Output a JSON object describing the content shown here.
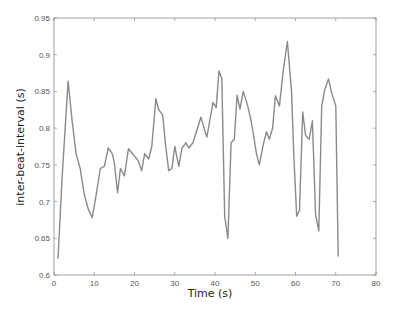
{
  "chart_data": {
    "type": "line",
    "title": "",
    "xlabel": "Time (s)",
    "ylabel": "inter-beat-interval (s)",
    "xlim": [
      0,
      80
    ],
    "ylim": [
      0.6,
      0.95
    ],
    "xticks": [
      "0",
      "10",
      "20",
      "30",
      "40",
      "50",
      "60",
      "70",
      "80"
    ],
    "yticks": [
      "0.6",
      "0.65",
      "0.7",
      "0.75",
      "0.8",
      "0.85",
      "0.9",
      "0.95"
    ],
    "grid": false,
    "legend": null,
    "series": [
      {
        "name": "inter-beat-interval",
        "color": "#8a8a8a",
        "x": [
          1,
          2,
          3.5,
          4.5,
          5.5,
          6.5,
          7.5,
          8.5,
          9.5,
          10.5,
          11.5,
          12.5,
          13.5,
          14.5,
          15,
          15.8,
          16.5,
          17.5,
          18.5,
          19.5,
          20.3,
          21,
          21.8,
          22.5,
          23.5,
          24.3,
          25.3,
          26,
          27,
          27.7,
          28.5,
          29.3,
          30,
          31,
          31.8,
          32.8,
          33.5,
          34.5,
          35.5,
          36.5,
          37.5,
          38,
          39,
          39.5,
          40.3,
          41,
          41.7,
          42.4,
          43.2,
          44,
          44.8,
          45.5,
          46.2,
          47,
          48,
          48.8,
          49.6,
          50.3,
          51,
          52,
          52.8,
          53.5,
          54.3,
          55,
          56,
          57,
          58,
          59,
          59.6,
          60.3,
          61,
          61.8,
          62.5,
          63.4,
          64.2,
          65,
          65.8,
          66.5,
          67.3,
          68.2,
          69,
          70,
          70.6
        ],
        "y": [
          0.622,
          0.73,
          0.864,
          0.81,
          0.765,
          0.745,
          0.71,
          0.69,
          0.678,
          0.71,
          0.745,
          0.748,
          0.773,
          0.765,
          0.752,
          0.712,
          0.745,
          0.735,
          0.772,
          0.765,
          0.76,
          0.755,
          0.742,
          0.765,
          0.758,
          0.775,
          0.84,
          0.825,
          0.818,
          0.778,
          0.742,
          0.745,
          0.775,
          0.748,
          0.773,
          0.78,
          0.773,
          0.78,
          0.797,
          0.815,
          0.796,
          0.788,
          0.82,
          0.835,
          0.828,
          0.878,
          0.868,
          0.68,
          0.65,
          0.78,
          0.785,
          0.845,
          0.826,
          0.85,
          0.833,
          0.815,
          0.79,
          0.765,
          0.75,
          0.778,
          0.795,
          0.785,
          0.8,
          0.844,
          0.83,
          0.88,
          0.918,
          0.85,
          0.76,
          0.68,
          0.688,
          0.822,
          0.79,
          0.785,
          0.81,
          0.682,
          0.66,
          0.83,
          0.853,
          0.867,
          0.848,
          0.83,
          0.625
        ]
      }
    ]
  }
}
